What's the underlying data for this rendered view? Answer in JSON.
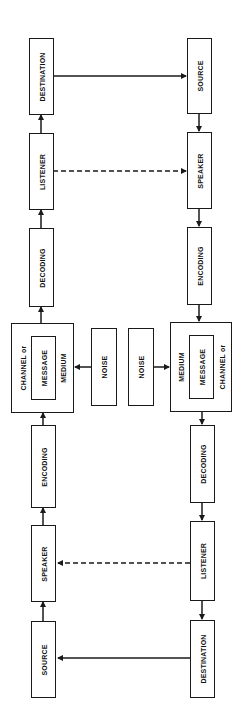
{
  "diagram": {
    "type": "communication-model",
    "colors": {
      "line": "#1a1a1a",
      "background": "#ffffff"
    },
    "left_chain": {
      "boxes": [
        {
          "id": "l-destination",
          "label": "DESTINATION"
        },
        {
          "id": "l-listener",
          "label": "LISTENER"
        },
        {
          "id": "l-decoding",
          "label": "DECODING"
        },
        {
          "id": "l-channel",
          "outer_label": "CHANNEL or",
          "inner_label": "MESSAGE",
          "medium_label": "MEDIUM"
        },
        {
          "id": "l-encoding",
          "label": "ENCODING"
        },
        {
          "id": "l-speaker",
          "label": "SPEAKER"
        },
        {
          "id": "l-source",
          "label": "SOURCE"
        }
      ]
    },
    "right_chain": {
      "boxes": [
        {
          "id": "r-source",
          "label": "SOURCE"
        },
        {
          "id": "r-speaker",
          "label": "SPEAKER"
        },
        {
          "id": "r-encoding",
          "label": "ENCODING"
        },
        {
          "id": "r-channel",
          "outer_label": "CHANNEL or",
          "inner_label": "MESSAGE",
          "medium_label": "MEDIUM"
        },
        {
          "id": "r-decoding",
          "label": "DECODING"
        },
        {
          "id": "r-listener",
          "label": "LISTENER"
        },
        {
          "id": "r-destination",
          "label": "DESTINATION"
        }
      ]
    },
    "noise": [
      {
        "id": "noise-left",
        "label": "NOISE"
      },
      {
        "id": "noise-right",
        "label": "NOISE"
      }
    ],
    "edges": [
      {
        "from": "l-source",
        "to": "l-speaker",
        "style": "solid"
      },
      {
        "from": "l-speaker",
        "to": "l-encoding",
        "style": "solid"
      },
      {
        "from": "l-encoding",
        "to": "l-channel",
        "style": "solid"
      },
      {
        "from": "l-channel",
        "to": "l-decoding",
        "style": "solid"
      },
      {
        "from": "l-decoding",
        "to": "l-listener",
        "style": "solid"
      },
      {
        "from": "l-listener",
        "to": "l-destination",
        "style": "solid"
      },
      {
        "from": "l-destination",
        "to": "r-source",
        "style": "solid"
      },
      {
        "from": "l-listener",
        "to": "r-speaker",
        "style": "dashed"
      },
      {
        "from": "r-source",
        "to": "r-speaker",
        "style": "solid"
      },
      {
        "from": "r-speaker",
        "to": "r-encoding",
        "style": "solid"
      },
      {
        "from": "r-encoding",
        "to": "r-channel",
        "style": "solid"
      },
      {
        "from": "r-channel",
        "to": "r-decoding",
        "style": "solid"
      },
      {
        "from": "r-decoding",
        "to": "r-listener",
        "style": "solid"
      },
      {
        "from": "r-listener",
        "to": "r-destination",
        "style": "solid"
      },
      {
        "from": "r-destination",
        "to": "l-source",
        "style": "solid"
      },
      {
        "from": "r-listener",
        "to": "l-speaker",
        "style": "dashed"
      },
      {
        "from": "noise-left",
        "to": "l-channel",
        "style": "solid"
      },
      {
        "from": "noise-right",
        "to": "r-channel",
        "style": "solid"
      }
    ]
  }
}
